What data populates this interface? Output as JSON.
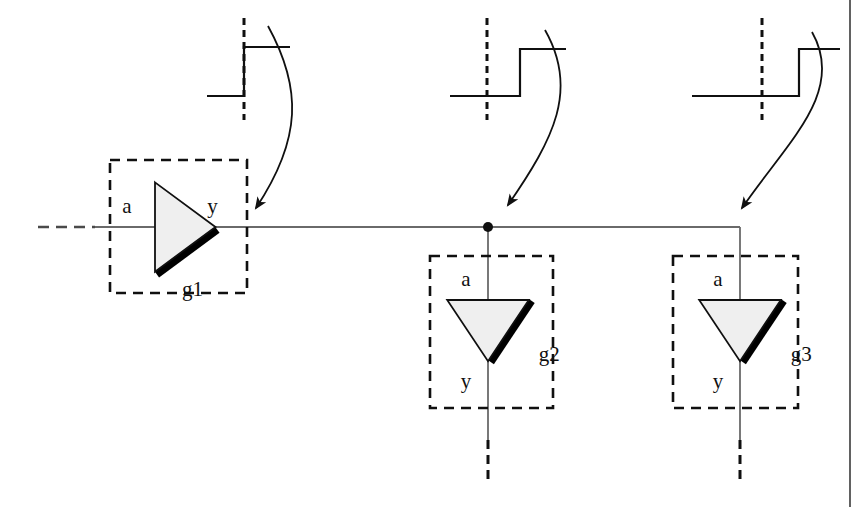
{
  "figure": {
    "kind": "digital-logic-propagation-diagram",
    "background_color": "#ffffff",
    "ink_color": "#101010",
    "wire_color": "#4a4a4a",
    "gate_fill_color": "#efefef",
    "shadow_color": "#000000",
    "width": 860,
    "height": 507,
    "page_edge_x": 850
  },
  "gates": [
    {
      "id": "g1",
      "name_label": "g1",
      "input_label": "a",
      "output_label": "y",
      "orientation": "right",
      "box": {
        "x": 110,
        "y": 160,
        "w": 137,
        "h": 133
      },
      "triangle": {
        "cx": 155,
        "cy": 227,
        "size": 72
      }
    },
    {
      "id": "g2",
      "name_label": "g2",
      "input_label": "a",
      "output_label": "y",
      "orientation": "down",
      "box": {
        "x": 430,
        "y": 256,
        "w": 123,
        "h": 152
      },
      "triangle": {
        "cx": 488,
        "cy": 300,
        "size": 68
      }
    },
    {
      "id": "g3",
      "name_label": "g3",
      "input_label": "a",
      "output_label": "y",
      "orientation": "down",
      "box": {
        "x": 673,
        "y": 256,
        "w": 125,
        "h": 152
      },
      "triangle": {
        "cx": 740,
        "cy": 300,
        "size": 68
      }
    }
  ],
  "nets": {
    "input_wire": {
      "name": "g1-input-net",
      "y": 227,
      "dashed_from_x": 38,
      "dashed_to_x": 95,
      "solid_to_x": 155
    },
    "output_wire": {
      "name": "g1-output-net",
      "y": 227,
      "from_x": 215,
      "to_x": 740
    },
    "junction_dot": {
      "x": 488,
      "y": 227,
      "r": 5
    },
    "g2_output_wire": {
      "x": 488,
      "solid_to_y": 440,
      "dashed_to_y": 482
    },
    "g3_output_wire": {
      "x": 740,
      "solid_to_y": 440,
      "dashed_to_y": 482
    }
  },
  "waveforms": [
    {
      "id": "wf1",
      "name": "waveform-g1-output",
      "describes_gate": "g1",
      "reference_edge_x": 244,
      "low_level_y": 96,
      "high_level_y": 47,
      "low_start_x": 207,
      "transition_x": 244,
      "high_end_x": 290,
      "delay_label": "zero-delay"
    },
    {
      "id": "wf2",
      "name": "waveform-g2-output",
      "describes_gate": "g2",
      "reference_edge_x": 487,
      "low_level_y": 96,
      "high_level_y": 49,
      "low_start_x": 450,
      "transition_x": 520,
      "high_end_x": 566,
      "delay_label": "short-delay"
    },
    {
      "id": "wf3",
      "name": "waveform-g3-output",
      "describes_gate": "g3",
      "reference_edge_x": 762,
      "low_level_y": 96,
      "high_level_y": 49,
      "low_start_x": 692,
      "transition_x": 799,
      "high_end_x": 840,
      "delay_label": "long-delay"
    }
  ],
  "annotation_arrows": [
    {
      "id": "ar1",
      "name": "arrow-waveform1-to-g1",
      "from": [
        268,
        26
      ],
      "to": [
        256,
        208
      ]
    },
    {
      "id": "ar2",
      "name": "arrow-waveform2-to-g2",
      "from": [
        545,
        30
      ],
      "to": [
        508,
        205
      ]
    },
    {
      "id": "ar3",
      "name": "arrow-waveform3-to-g3",
      "from": [
        812,
        32
      ],
      "to": [
        742,
        208
      ]
    }
  ]
}
